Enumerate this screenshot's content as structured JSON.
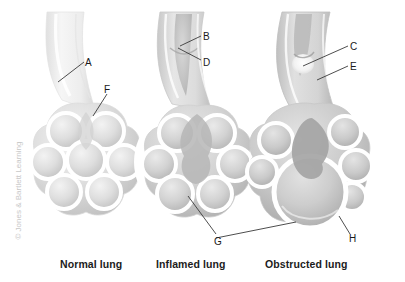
{
  "figure": {
    "background_color": "#ffffff",
    "width": 405,
    "height": 282,
    "copyright": "© Jones & Bartlett Learning"
  },
  "panels": [
    {
      "id": "normal",
      "caption": "Normal lung",
      "description": "Open bronchiole leading to a cluster of normal alveolar sacs",
      "labels": [
        "A",
        "F"
      ]
    },
    {
      "id": "inflamed",
      "caption": "Inflamed lung",
      "description": "Bronchiole with thickened inflamed walls and narrowed lumen",
      "labels": [
        "B",
        "D",
        "G"
      ]
    },
    {
      "id": "obstructed",
      "caption": "Obstructed lung",
      "description": "Bronchiole blocked by a mucus plug with a distended alveolus",
      "labels": [
        "C",
        "E",
        "H"
      ]
    }
  ],
  "labels": {
    "a": "A",
    "b": "B",
    "c": "C",
    "d": "D",
    "e": "E",
    "f": "F",
    "g": "G",
    "h": "H"
  },
  "colors": {
    "background": "#ffffff",
    "tissue_light": "#e9e9e9",
    "tissue_mid": "#cfcfcf",
    "tissue_dark": "#b0b0b0",
    "wall": "#ffffff",
    "outline": "#d8d8d8",
    "leader_line": "#3a3a3a",
    "label_text": "#1a1a1a",
    "caption_text": "#1c1c1c",
    "copyright_text": "#c8c8c8"
  }
}
